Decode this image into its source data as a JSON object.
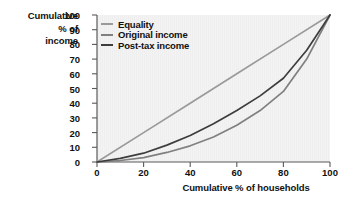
{
  "chart_data": {
    "type": "line",
    "title": "",
    "xlabel": "Cumulative % of households",
    "ylabel": "Cumulative % of income",
    "ylabel_lines": [
      "Cumulative",
      "% of",
      "income"
    ],
    "xlim": [
      0,
      100
    ],
    "ylim": [
      0,
      100
    ],
    "xticks": [
      0,
      20,
      40,
      60,
      80,
      100
    ],
    "yticks": [
      0,
      10,
      20,
      30,
      40,
      50,
      60,
      70,
      80,
      90,
      100
    ],
    "xtick_labels": [
      "0",
      "20",
      "40",
      "60",
      "80",
      "100"
    ],
    "ytick_labels": [
      "0",
      "10",
      "20",
      "30",
      "40",
      "50",
      "60",
      "70",
      "80",
      "90",
      "100"
    ],
    "grid": false,
    "legend_position": "top-left-inside",
    "plot_background": "#f2f2f2",
    "series": [
      {
        "name": "Equality",
        "color": "#9a9a9a",
        "x": [
          0,
          20,
          40,
          60,
          80,
          100
        ],
        "values": [
          0,
          20,
          40,
          60,
          80,
          100
        ]
      },
      {
        "name": "Original income",
        "color": "#808080",
        "x": [
          0,
          10,
          20,
          30,
          40,
          50,
          60,
          70,
          80,
          90,
          100
        ],
        "values": [
          0,
          1,
          3,
          6.5,
          11,
          17,
          25,
          35,
          48,
          70,
          100
        ]
      },
      {
        "name": "Post-tax income",
        "color": "#3d3d3d",
        "x": [
          0,
          10,
          20,
          30,
          40,
          50,
          60,
          70,
          80,
          90,
          100
        ],
        "values": [
          0,
          2.5,
          6,
          11.5,
          18,
          26,
          35,
          45,
          57,
          76,
          100
        ]
      }
    ]
  },
  "legend": {
    "items": [
      {
        "label": "Equality",
        "color": "#9a9a9a"
      },
      {
        "label": "Original income",
        "color": "#808080"
      },
      {
        "label": "Post-tax income",
        "color": "#3d3d3d"
      }
    ]
  },
  "axes": {
    "x_title": "Cumulative % of households",
    "y_title_line1": "Cumulative",
    "y_title_line2": "% of",
    "y_title_line3": "income",
    "x_labels": [
      "0",
      "20",
      "40",
      "60",
      "80",
      "100"
    ],
    "y_labels": [
      "0",
      "10",
      "20",
      "30",
      "40",
      "50",
      "60",
      "70",
      "80",
      "90",
      "100"
    ]
  }
}
